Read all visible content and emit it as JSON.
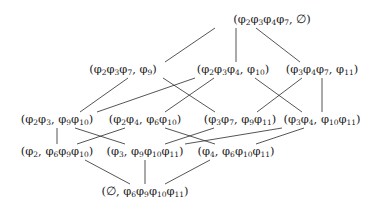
{
  "diagram": {
    "type": "hasse-lattice",
    "nodes": [
      {
        "id": "n0",
        "label": "(φ2φ3φ4φ7, ∅)",
        "x": 272,
        "y": 20,
        "parts": [
          [
            "(",
            ""
          ],
          [
            "φ",
            "2"
          ],
          [
            "φ",
            "3"
          ],
          [
            "φ",
            "4"
          ],
          [
            "φ",
            "7"
          ],
          [
            ", ∅)",
            ""
          ]
        ]
      },
      {
        "id": "n1a",
        "label": "(φ2φ3φ7, φ9)",
        "x": 123,
        "y": 70,
        "parts": [
          [
            "(",
            ""
          ],
          [
            "φ",
            "2"
          ],
          [
            "φ",
            "3"
          ],
          [
            "φ",
            "7"
          ],
          [
            ", ",
            ""
          ],
          [
            "φ",
            "9"
          ],
          [
            ")",
            ""
          ]
        ]
      },
      {
        "id": "n1b",
        "label": "(φ2φ3φ4, φ10)",
        "x": 233,
        "y": 70,
        "parts": [
          [
            "(",
            ""
          ],
          [
            "φ",
            "2"
          ],
          [
            "φ",
            "3"
          ],
          [
            "φ",
            "4"
          ],
          [
            ", ",
            ""
          ],
          [
            "φ",
            "10"
          ],
          [
            ")",
            ""
          ]
        ]
      },
      {
        "id": "n1c",
        "label": "(φ3φ4φ7, φ11)",
        "x": 322,
        "y": 70,
        "parts": [
          [
            "(",
            ""
          ],
          [
            "φ",
            "3"
          ],
          [
            "φ",
            "4"
          ],
          [
            "φ",
            "7"
          ],
          [
            ", ",
            ""
          ],
          [
            "φ",
            "11"
          ],
          [
            ")",
            ""
          ]
        ]
      },
      {
        "id": "n2a",
        "label": "(φ2φ3, φ9φ10)",
        "x": 57,
        "y": 120,
        "parts": [
          [
            "(",
            ""
          ],
          [
            "φ",
            "2"
          ],
          [
            "φ",
            "3"
          ],
          [
            ", ",
            ""
          ],
          [
            "φ",
            "9"
          ],
          [
            "φ",
            "10"
          ],
          [
            ")",
            ""
          ]
        ]
      },
      {
        "id": "n2b",
        "label": "(φ2φ4, φ6φ10)",
        "x": 145,
        "y": 120,
        "parts": [
          [
            "(",
            ""
          ],
          [
            "φ",
            "2"
          ],
          [
            "φ",
            "4"
          ],
          [
            ", ",
            ""
          ],
          [
            "φ",
            "6"
          ],
          [
            "φ",
            "10"
          ],
          [
            ")",
            ""
          ]
        ]
      },
      {
        "id": "n2c",
        "label": "(φ3φ7, φ9φ11)",
        "x": 240,
        "y": 120,
        "parts": [
          [
            "(",
            ""
          ],
          [
            "φ",
            "3"
          ],
          [
            "φ",
            "7"
          ],
          [
            ", ",
            ""
          ],
          [
            "φ",
            "9"
          ],
          [
            "φ",
            "11"
          ],
          [
            ")",
            ""
          ]
        ]
      },
      {
        "id": "n2d",
        "label": "(φ3φ4, φ10φ11)",
        "x": 322,
        "y": 120,
        "parts": [
          [
            "(",
            ""
          ],
          [
            "φ",
            "3"
          ],
          [
            "φ",
            "4"
          ],
          [
            ", ",
            ""
          ],
          [
            "φ",
            "10"
          ],
          [
            "φ",
            "11"
          ],
          [
            ")",
            ""
          ]
        ]
      },
      {
        "id": "n3a",
        "label": "(φ2, φ6φ9φ10)",
        "x": 57,
        "y": 152,
        "parts": [
          [
            "(",
            ""
          ],
          [
            "φ",
            "2"
          ],
          [
            ", ",
            ""
          ],
          [
            "φ",
            "6"
          ],
          [
            "φ",
            "9"
          ],
          [
            "φ",
            "10"
          ],
          [
            ")",
            ""
          ]
        ]
      },
      {
        "id": "n3b",
        "label": "(φ3, φ9φ10φ11)",
        "x": 145,
        "y": 152,
        "parts": [
          [
            "(",
            ""
          ],
          [
            "φ",
            "3"
          ],
          [
            ", ",
            ""
          ],
          [
            "φ",
            "9"
          ],
          [
            "φ",
            "10"
          ],
          [
            "φ",
            "11"
          ],
          [
            ")",
            ""
          ]
        ]
      },
      {
        "id": "n3c",
        "label": "(φ4, φ6φ10φ11)",
        "x": 236,
        "y": 152,
        "parts": [
          [
            "(",
            ""
          ],
          [
            "φ",
            "4"
          ],
          [
            ", ",
            ""
          ],
          [
            "φ",
            "6"
          ],
          [
            "φ",
            "10"
          ],
          [
            "φ",
            "11"
          ],
          [
            ")",
            ""
          ]
        ]
      },
      {
        "id": "n4",
        "label": "(∅, φ6φ9φ10φ11)",
        "x": 145,
        "y": 192,
        "parts": [
          [
            "(∅, ",
            ""
          ],
          [
            "φ",
            "6"
          ],
          [
            "φ",
            "9"
          ],
          [
            "φ",
            "10"
          ],
          [
            "φ",
            "11"
          ],
          [
            ")",
            ""
          ]
        ]
      }
    ],
    "edges": [
      {
        "from": "n0",
        "to": "n1a",
        "x1": 215,
        "y1": 28,
        "x2": 165,
        "y2": 62
      },
      {
        "from": "n0",
        "to": "n1b",
        "x1": 236,
        "y1": 28,
        "x2": 236,
        "y2": 62
      },
      {
        "from": "n0",
        "to": "n1c",
        "x1": 256,
        "y1": 28,
        "x2": 300,
        "y2": 62
      },
      {
        "from": "n1a",
        "to": "n2a",
        "x1": 128,
        "y1": 78,
        "x2": 80,
        "y2": 112
      },
      {
        "from": "n1a",
        "to": "n2c",
        "x1": 163,
        "y1": 78,
        "x2": 215,
        "y2": 112
      },
      {
        "from": "n1b",
        "to": "n2a",
        "x1": 195,
        "y1": 78,
        "x2": 97,
        "y2": 112
      },
      {
        "from": "n1b",
        "to": "n2b",
        "x1": 214,
        "y1": 78,
        "x2": 165,
        "y2": 112
      },
      {
        "from": "n1b",
        "to": "n2d",
        "x1": 255,
        "y1": 78,
        "x2": 302,
        "y2": 112
      },
      {
        "from": "n1c",
        "to": "n2c",
        "x1": 302,
        "y1": 78,
        "x2": 257,
        "y2": 112
      },
      {
        "from": "n1c",
        "to": "n2d",
        "x1": 322,
        "y1": 78,
        "x2": 322,
        "y2": 112
      },
      {
        "from": "n2a",
        "to": "n3a",
        "x1": 57,
        "y1": 128,
        "x2": 57,
        "y2": 144
      },
      {
        "from": "n2a",
        "to": "n3b",
        "x1": 75,
        "y1": 128,
        "x2": 125,
        "y2": 144
      },
      {
        "from": "n2b",
        "to": "n3a",
        "x1": 125,
        "y1": 128,
        "x2": 77,
        "y2": 144
      },
      {
        "from": "n2b",
        "to": "n3c",
        "x1": 165,
        "y1": 128,
        "x2": 215,
        "y2": 144
      },
      {
        "from": "n2c",
        "to": "n3b",
        "x1": 214,
        "y1": 128,
        "x2": 165,
        "y2": 144
      },
      {
        "from": "n2d",
        "to": "n3b",
        "x1": 282,
        "y1": 128,
        "x2": 185,
        "y2": 144
      },
      {
        "from": "n2d",
        "to": "n3c",
        "x1": 304,
        "y1": 128,
        "x2": 256,
        "y2": 144
      },
      {
        "from": "n3a",
        "to": "n4",
        "x1": 85,
        "y1": 160,
        "x2": 130,
        "y2": 184
      },
      {
        "from": "n3b",
        "to": "n4",
        "x1": 145,
        "y1": 160,
        "x2": 145,
        "y2": 184
      },
      {
        "from": "n3c",
        "to": "n4",
        "x1": 210,
        "y1": 160,
        "x2": 165,
        "y2": 184
      }
    ]
  }
}
